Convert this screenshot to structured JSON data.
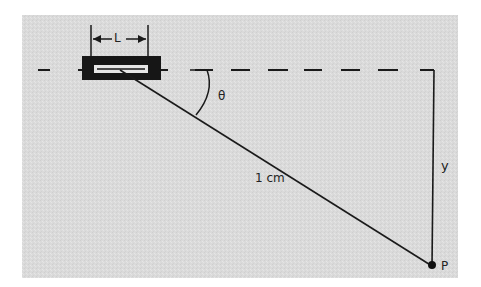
{
  "diagram": {
    "background_color": "#dcdcdc",
    "line_color": "#1a1a1a",
    "labels": {
      "length": "L",
      "angle": "θ",
      "distance": "1 cm",
      "vertical": "y",
      "point": "P"
    },
    "elements": {
      "slit_box": "rectangular source/slit of length L",
      "dashed_line": "horizontal dashed reference line",
      "hypotenuse": "line from source to point P, length 1 cm",
      "vertical_line": "vertical line of height y down to P",
      "angle_arc": "arc marking angle θ"
    }
  }
}
